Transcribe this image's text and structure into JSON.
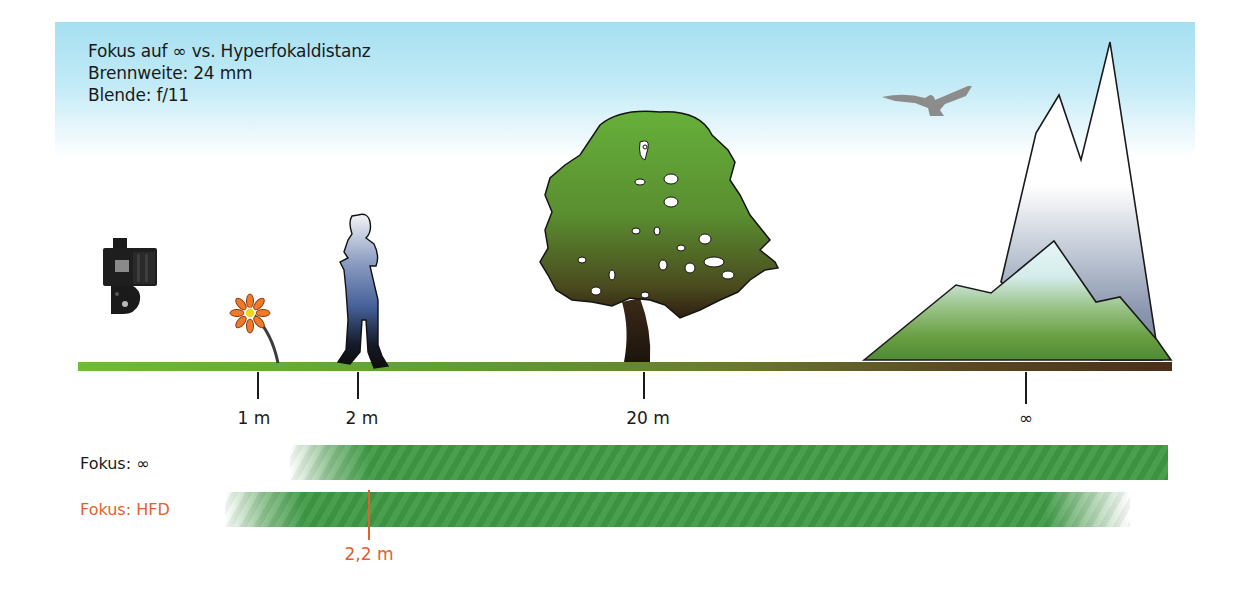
{
  "title_block": {
    "title": "Fokus auf ∞ vs. Hyperfokaldistanz",
    "focal_length": "Brennweite: 24 mm",
    "aperture": "Blende: f/11"
  },
  "scene": {
    "objects": [
      {
        "name": "camera",
        "icon": "camera-icon"
      },
      {
        "name": "flower",
        "icon": "flower-icon",
        "distance": "1 m"
      },
      {
        "name": "person",
        "icon": "person-icon",
        "distance": "2 m"
      },
      {
        "name": "tree",
        "icon": "tree-icon",
        "distance": "20 m"
      },
      {
        "name": "bird",
        "icon": "bird-icon"
      },
      {
        "name": "mountains",
        "icon": "mountain-icon",
        "distance": "∞"
      }
    ]
  },
  "axis": {
    "ticks": [
      {
        "label": "1 m",
        "x": 258
      },
      {
        "label": "2 m",
        "x": 358
      },
      {
        "label": "20 m",
        "x": 644
      },
      {
        "label": "∞",
        "x": 1026
      }
    ]
  },
  "bars": {
    "infinity": {
      "label": "Fokus: ∞",
      "label_color": "#1a1a1a"
    },
    "hfd": {
      "label": "Fokus: HFD",
      "label_color": "#e0612c",
      "marker_label": "2,2 m"
    }
  },
  "colors": {
    "sky": "#a7e0f1",
    "sharp_zone": "#3f9a45",
    "accent_orange": "#e0612c",
    "ground_start": "#6dbb3c",
    "ground_end": "#4a2e1a"
  }
}
